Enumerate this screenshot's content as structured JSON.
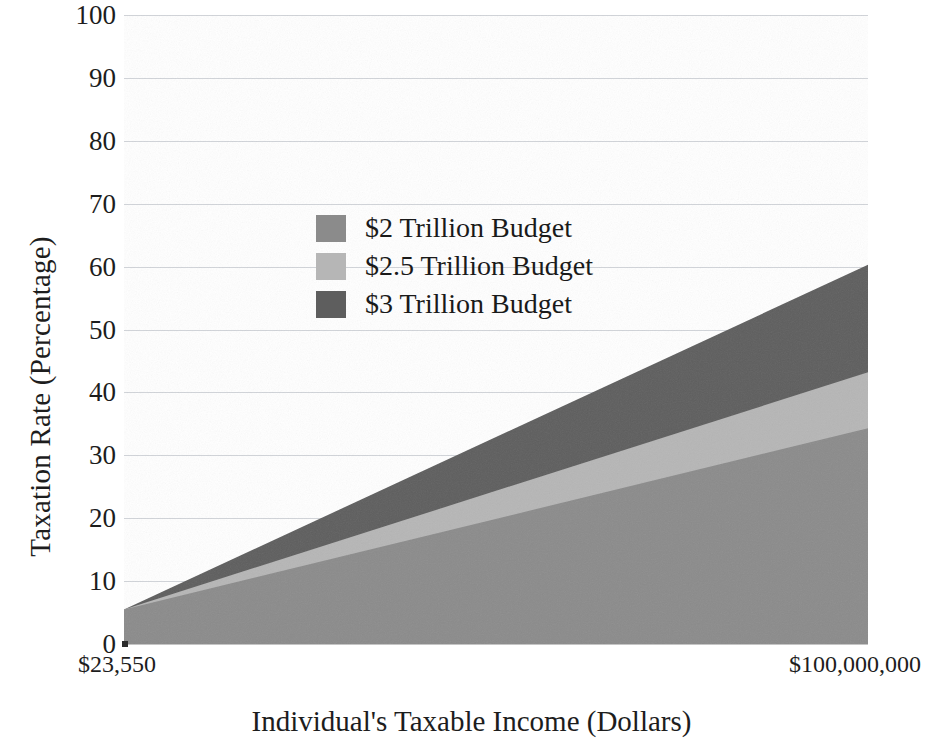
{
  "chart_data": {
    "type": "area",
    "title": "",
    "subtitle": "",
    "xlabel": "Individual's Taxable Income (Dollars)",
    "ylabel": "Taxation Rate (Percentage)",
    "ylim": [
      0,
      100
    ],
    "ytick_labels": [
      "100",
      "90",
      "80",
      "70",
      "60",
      "50",
      "40",
      "30",
      "20",
      "10",
      "0"
    ],
    "ytick_values": [
      100,
      90,
      80,
      70,
      60,
      50,
      40,
      30,
      20,
      10,
      0
    ],
    "xtick_labels": [
      "$23,550",
      "$100,000,000"
    ],
    "xtick_values": [
      23550,
      100000000
    ],
    "x": [
      23550,
      100000000
    ],
    "grid": true,
    "legend_position": "upper-center-left",
    "stacked": false,
    "series": [
      {
        "name": "$2 Trillion Budget",
        "color": "#8b8b8b",
        "values": [
          5.5,
          34.3
        ]
      },
      {
        "name": "$2.5 Trillion Budget",
        "color": "#b6b6b6",
        "values": [
          5.5,
          43.2
        ]
      },
      {
        "name": "$3 Trillion Budget",
        "color": "#5e5e5e",
        "values": [
          5.5,
          60.3
        ]
      }
    ],
    "annotations": []
  },
  "axes": {
    "y_title": "Taxation Rate (Percentage)",
    "x_title": "Individual's Taxable Income (Dollars)",
    "y_ticks": [
      "100",
      "90",
      "80",
      "70",
      "60",
      "50",
      "40",
      "30",
      "20",
      "10",
      "0"
    ],
    "x_tick_left": "$23,550",
    "x_tick_right": "$100,000,000"
  },
  "legend": {
    "items": [
      {
        "label": "$2 Trillion Budget",
        "color": "#8b8b8b"
      },
      {
        "label": "$2.5 Trillion Budget",
        "color": "#b6b6b6"
      },
      {
        "label": "$3 Trillion Budget",
        "color": "#5e5e5e"
      }
    ]
  },
  "colors": {
    "background": "#ffffff",
    "text": "#1a1a1a",
    "gridline": "#c9ccd2",
    "budget_2t": "#8b8b8b",
    "budget_25t": "#b6b6b6",
    "budget_3t": "#5e5e5e"
  }
}
